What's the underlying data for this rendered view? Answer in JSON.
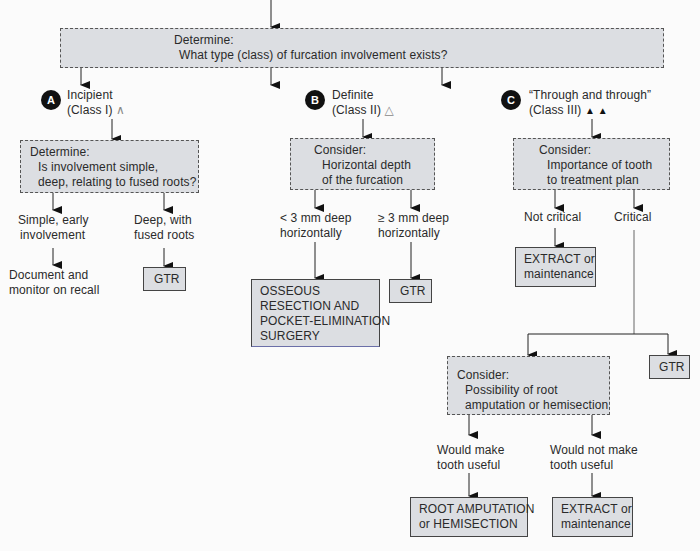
{
  "top": {
    "heading": "Determine:",
    "question": "What type (class) of furcation involvement exists?"
  },
  "branches": {
    "a": {
      "badge": "A",
      "title": "Incipient",
      "class_label": "(Class I)",
      "symbol": "∧",
      "box": {
        "heading": "Determine:",
        "line1": "Is involvement simple,",
        "line2": "deep, relating to fused roots?"
      },
      "left": {
        "line1": "Simple, early",
        "line2": "involvement",
        "result1": "Document and",
        "result2": "monitor on recall"
      },
      "right": {
        "line1": "Deep, with",
        "line2": "fused roots",
        "result": "GTR"
      }
    },
    "b": {
      "badge": "B",
      "title": "Definite",
      "class_label": "(Class II)",
      "symbol": "△",
      "box": {
        "heading": "Consider:",
        "line1": "Horizontal depth",
        "line2": "of the furcation"
      },
      "left": {
        "line1": "< 3 mm deep",
        "line2": "horizontally",
        "result": [
          "OSSEOUS",
          "RESECTION AND",
          "POCKET-ELIMINATION",
          "SURGERY"
        ]
      },
      "right": {
        "line1": "≥ 3 mm deep",
        "line2": "horizontally",
        "result": "GTR"
      }
    },
    "c": {
      "badge": "C",
      "title": "“Through and through”",
      "class_label": "(Class III)",
      "symbol": "▲ ▲",
      "box": {
        "heading": "Consider:",
        "line1": "Importance of tooth",
        "line2": "to treatment plan"
      },
      "left": {
        "label": "Not critical",
        "result1": "EXTRACT or",
        "result2": "maintenance"
      },
      "right": {
        "label": "Critical",
        "gtr": "GTR"
      },
      "sub": {
        "box": {
          "heading": "Consider:",
          "line1": "Possibility of root",
          "line2": "amputation or hemisection"
        },
        "left": {
          "line1": "Would make",
          "line2": "tooth useful",
          "result1": "ROOT AMPUTATION",
          "result2": "or HEMISECTION"
        },
        "right": {
          "line1": "Would not make",
          "line2": "tooth useful",
          "result1": "EXTRACT or",
          "result2": "maintenance"
        }
      }
    }
  }
}
